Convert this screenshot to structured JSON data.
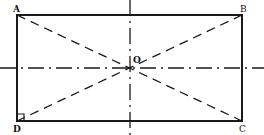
{
  "diagram": {
    "type": "rectangle-with-axes",
    "labels": {
      "A": "A",
      "B": "B",
      "C": "C",
      "D": "D",
      "O": "O"
    },
    "colors": {
      "stroke": "#1a1a1a",
      "background": "#ffffff"
    },
    "elements": [
      "rectangle ABCD",
      "diagonal AC (dashed)",
      "diagonal BD (dashed)",
      "horizontal axis of symmetry (dash-dot)",
      "vertical axis of symmetry (dash-dot)",
      "right-angle mark at D",
      "center point O"
    ]
  }
}
